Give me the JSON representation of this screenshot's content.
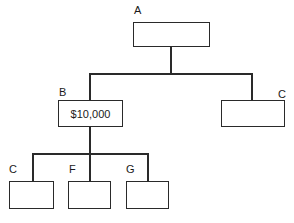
{
  "diagram": {
    "type": "org-chart",
    "nodes": {
      "a": {
        "label": "A",
        "value": ""
      },
      "b": {
        "label": "B",
        "value": "$10,000"
      },
      "c_right": {
        "label": "C",
        "value": ""
      },
      "c_bottom": {
        "label": "C",
        "value": ""
      },
      "f": {
        "label": "F",
        "value": ""
      },
      "g": {
        "label": "G",
        "value": ""
      }
    },
    "edges": [
      [
        "A",
        "B"
      ],
      [
        "A",
        "C"
      ],
      [
        "B",
        "C"
      ],
      [
        "B",
        "F"
      ],
      [
        "B",
        "G"
      ]
    ]
  }
}
